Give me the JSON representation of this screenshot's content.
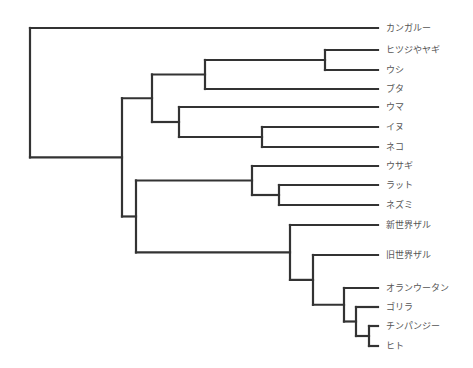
{
  "diagram": {
    "type": "phylogenetic-tree",
    "line_color": "#333333",
    "label_color": "#555555",
    "leaf_line_end_x": 378,
    "label_x": 386,
    "leaves": [
      {
        "id": "kangaroo",
        "label": "カンガルー",
        "y": 28
      },
      {
        "id": "sheep-goat",
        "label": "ヒツジやヤギ",
        "y": 50
      },
      {
        "id": "cow",
        "label": "ウシ",
        "y": 70
      },
      {
        "id": "pig",
        "label": "ブタ",
        "y": 89
      },
      {
        "id": "horse",
        "label": "ウマ",
        "y": 107
      },
      {
        "id": "dog",
        "label": "イヌ",
        "y": 127
      },
      {
        "id": "cat",
        "label": "ネコ",
        "y": 147
      },
      {
        "id": "rabbit",
        "label": "ウサギ",
        "y": 166
      },
      {
        "id": "rat",
        "label": "ラット",
        "y": 185
      },
      {
        "id": "mouse",
        "label": "ネズミ",
        "y": 205
      },
      {
        "id": "new-world-monkey",
        "label": "新世界ザル",
        "y": 225
      },
      {
        "id": "old-world-monkey",
        "label": "旧世界ザル",
        "y": 255
      },
      {
        "id": "orangutan",
        "label": "オランウータン",
        "y": 288
      },
      {
        "id": "gorilla",
        "label": "ゴリラ",
        "y": 307
      },
      {
        "id": "chimpanzee",
        "label": "チンパンジー",
        "y": 326
      },
      {
        "id": "human",
        "label": "ヒト",
        "y": 346
      }
    ],
    "nodes": [
      {
        "id": "root",
        "x": 30,
        "children": [
          "kangaroo",
          "placentals"
        ]
      },
      {
        "id": "placentals",
        "x": 122,
        "children": [
          "laurasiatheria",
          "euarchontoglires"
        ]
      },
      {
        "id": "laurasiatheria",
        "x": 152,
        "children": [
          "cetartiodactyla",
          "ferae-horse"
        ]
      },
      {
        "id": "cetartiodactyla",
        "x": 205,
        "children": [
          "ruminants",
          "pig"
        ]
      },
      {
        "id": "ruminants",
        "x": 325,
        "children": [
          "sheep-goat",
          "cow"
        ]
      },
      {
        "id": "ferae-horse",
        "x": 179,
        "children": [
          "horse",
          "carnivora"
        ]
      },
      {
        "id": "carnivora",
        "x": 262,
        "children": [
          "dog",
          "cat"
        ]
      },
      {
        "id": "euarchontoglires",
        "x": 136,
        "children": [
          "glires",
          "primates"
        ]
      },
      {
        "id": "glires",
        "x": 252,
        "children": [
          "rabbit",
          "rodents"
        ]
      },
      {
        "id": "rodents",
        "x": 279,
        "children": [
          "rat",
          "mouse"
        ]
      },
      {
        "id": "primates",
        "x": 290,
        "children": [
          "new-world-monkey",
          "catarrhini"
        ]
      },
      {
        "id": "catarrhini",
        "x": 313,
        "children": [
          "old-world-monkey",
          "hominidae"
        ]
      },
      {
        "id": "hominidae",
        "x": 344,
        "children": [
          "orangutan",
          "homininae"
        ]
      },
      {
        "id": "homininae",
        "x": 356,
        "children": [
          "gorilla",
          "hominini"
        ]
      },
      {
        "id": "hominini",
        "x": 369,
        "children": [
          "chimpanzee",
          "human"
        ]
      }
    ]
  }
}
